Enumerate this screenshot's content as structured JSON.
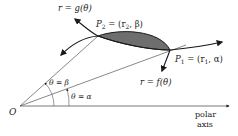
{
  "figure": {
    "labels": {
      "g_curve": "r = g(θ)",
      "f_curve": "r = f(θ)",
      "p2": "P",
      "p2_sub": "2",
      "p2_coords": " = (r",
      "p2_coords_sub": "2",
      "p2_coords_end": ", β)",
      "p1": "P",
      "p1_sub": "1",
      "p1_coords": " = (r",
      "p1_coords_sub": "1",
      "p1_coords_end": ", α)",
      "theta_beta": "θ = β",
      "theta_alpha": "θ = α",
      "origin": "O",
      "polar_axis_line1": "polar",
      "polar_axis_line2": "axis"
    },
    "colors": {
      "stroke": "#1a1a1a",
      "shade": "#6e6e6e",
      "ray": "#555555"
    }
  }
}
